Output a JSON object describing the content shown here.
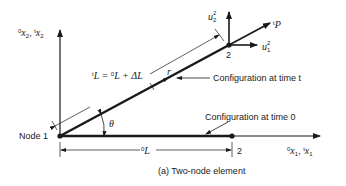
{
  "diagram": {
    "caption": "(a)  Two-node element",
    "node1_label": "Node 1",
    "node2_deformed_label": "2",
    "node2_original_label": "2",
    "config_t_label": "Configuration at time t",
    "config_0_label": "Configuration at time 0",
    "theta_label": "θ",
    "r_label": "r",
    "force_label": "P",
    "force_sup": "t",
    "length_t_label": {
      "pre_sup": "t",
      "L1": "L = ",
      "mid_sup": "0",
      "L2": "L + ΔL"
    },
    "length_0_label": {
      "sup": "0",
      "main": "L"
    },
    "u2": {
      "main": "u",
      "sup": "2",
      "sub": "2"
    },
    "u1": {
      "main": "u",
      "sup": "2",
      "sub": "1"
    },
    "axis_x2": {
      "sup1": "0",
      "x1": "x",
      "sub1": "2",
      "comma": ", ",
      "sup2": "t",
      "x2": "x",
      "sub2": "2"
    },
    "axis_x1": {
      "sup1": "0",
      "x1": "x",
      "sub1": "1",
      "comma": ", ",
      "sup2": "t",
      "x2": "x",
      "sub2": "1"
    },
    "colors": {
      "line": "#1a1a1a",
      "background": "#ffffff"
    }
  }
}
